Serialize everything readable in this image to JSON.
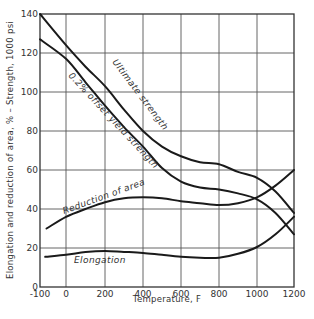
{
  "chart_data": {
    "type": "line",
    "title": "",
    "xlabel": "Temperature, F",
    "ylabel": "Elongation and reduction of area, % – Strength, 1000 psi",
    "xlim": [
      -100,
      1200
    ],
    "ylim": [
      0,
      140
    ],
    "x_ticks": [
      -100,
      0,
      200,
      400,
      600,
      800,
      1000,
      1200
    ],
    "x_tick_labels": [
      "-100",
      "0",
      "200",
      "400",
      "600",
      "800",
      "1000",
      "1200"
    ],
    "y_ticks": [
      0,
      20,
      40,
      60,
      80,
      100,
      120,
      140
    ],
    "y_tick_labels": [
      "0",
      "20",
      "40",
      "60",
      "80",
      "100",
      "120",
      "140"
    ],
    "grid": true,
    "legend": "inline curve labels",
    "series": [
      {
        "name": "Ultimate strength",
        "x": [
          -100,
          0,
          100,
          200,
          300,
          400,
          500,
          600,
          700,
          800,
          900,
          1000,
          1100,
          1200
        ],
        "y": [
          140,
          124,
          113,
          103,
          91,
          80,
          72,
          67,
          64,
          63,
          59,
          56,
          49,
          38
        ]
      },
      {
        "name": "0.2% offset yield strength",
        "x": [
          -100,
          0,
          100,
          200,
          300,
          400,
          500,
          600,
          700,
          800,
          900,
          1000,
          1100,
          1200
        ],
        "y": [
          127,
          117,
          105,
          93,
          82,
          72,
          61,
          54,
          51,
          50,
          48,
          45,
          38,
          27
        ]
      },
      {
        "name": "Reduction of area",
        "x": [
          -75,
          0,
          100,
          200,
          300,
          400,
          500,
          600,
          700,
          800,
          900,
          1000,
          1100,
          1200
        ],
        "y": [
          30,
          36,
          40,
          43.5,
          45.5,
          46,
          45.5,
          44,
          43,
          42,
          43,
          46,
          52,
          60
        ]
      },
      {
        "name": "Elongation",
        "x": [
          -80,
          0,
          100,
          200,
          300,
          400,
          500,
          600,
          700,
          800,
          900,
          1000,
          1100,
          1200
        ],
        "y": [
          15.5,
          16.5,
          18,
          18.5,
          18,
          17.5,
          16.5,
          15.5,
          15,
          15,
          17,
          20.5,
          27,
          36
        ]
      }
    ],
    "curve_labels": {
      "ultimate": "Ultimate strength",
      "yield": "0.2% offset yield strength",
      "reduction": "Reduction of area",
      "elongation": "Elongation"
    }
  }
}
